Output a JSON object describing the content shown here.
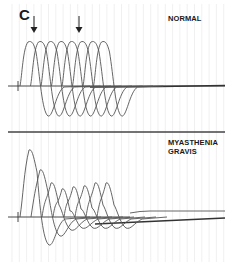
{
  "figure": {
    "panel_label": "C",
    "panels": [
      {
        "id": "normal",
        "label": "NORMAL",
        "arrows": 2,
        "waveform_count": 8,
        "description": "Repetitive nerve stimulation: compound muscle action potentials of constant amplitude"
      },
      {
        "id": "myasthenia",
        "label_line1": "MYASTHENIA",
        "label_line2": "GRAVIS",
        "waveform_count": 8,
        "description": "Repetitive nerve stimulation: decremental compound muscle action potential amplitudes"
      }
    ],
    "colors": {
      "trace": "#555555",
      "baseline": "#333333",
      "grid": "#e6e6e6",
      "divider": "#444444"
    }
  }
}
